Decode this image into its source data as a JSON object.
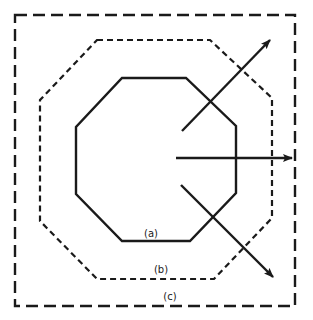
{
  "diagram": {
    "boundaries": [
      {
        "id": "a",
        "label": "(a)",
        "shape": "octagon",
        "stroke": "solid"
      },
      {
        "id": "b",
        "label": "(b)",
        "shape": "octagon",
        "stroke": "short-dashed"
      },
      {
        "id": "c",
        "label": "(c)",
        "shape": "square",
        "stroke": "long-dashed"
      }
    ],
    "arrows": [
      {
        "name": "upper-right-arrow",
        "direction": "up-right"
      },
      {
        "name": "right-arrow",
        "direction": "right"
      },
      {
        "name": "lower-right-arrow",
        "direction": "down-right"
      }
    ],
    "colors": {
      "line": "#1a1a1a",
      "background": "#ffffff"
    }
  }
}
